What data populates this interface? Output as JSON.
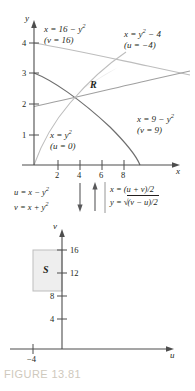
{
  "figure": {
    "caption": "FIGURE 13.81",
    "caption_color": "#cfc9bd"
  },
  "xy_plot": {
    "axis_x_label": "x",
    "axis_y_label": "y",
    "x_ticks": [
      "2",
      "4",
      "6",
      "8"
    ],
    "y_ticks": [
      "1",
      "2",
      "3",
      "4"
    ],
    "region_label": "R",
    "curves": [
      {
        "name": "curve-x-equals-16-minus-y-squared",
        "equation_main": "x = 16 − y",
        "equation_exp": "2",
        "equation_param": "(v = 16)",
        "color": "#b3b3b3"
      },
      {
        "name": "curve-x-equals-y-squared-minus-4",
        "equation_main": "x = y",
        "equation_exp": "2",
        "equation_tail": " − 4",
        "equation_param": "(u = −4)",
        "color": "#808080"
      },
      {
        "name": "curve-x-equals-9-minus-y-squared",
        "equation_main": "x = 9 − y",
        "equation_exp": "2",
        "equation_param": "(v = 9)",
        "color": "#6e6e6e"
      },
      {
        "name": "curve-x-equals-y-squared",
        "equation_main": "x = y",
        "equation_exp": "2",
        "equation_param": "(u = 0)",
        "color": "#b3b3b3"
      }
    ]
  },
  "transform": {
    "forward": {
      "line1_main": "u = x − y",
      "line1_exp": "2",
      "line2_main": "v = x + y",
      "line2_exp": "2"
    },
    "inverse": {
      "line1": "x = (u + v)/2",
      "line2_pre": "y = ",
      "line2_radical": "(v − u)/2"
    }
  },
  "uv_plot": {
    "axis_u_label": "u",
    "axis_v_label": "v",
    "u_ticks": [
      "−4"
    ],
    "v_ticks": [
      "4",
      "8",
      "12",
      "16"
    ],
    "region_label": "S",
    "region_bounds": {
      "u_min": -4,
      "u_max": 0,
      "v_min": 9,
      "v_max": 16
    },
    "region_fill": "#eeeeee"
  }
}
